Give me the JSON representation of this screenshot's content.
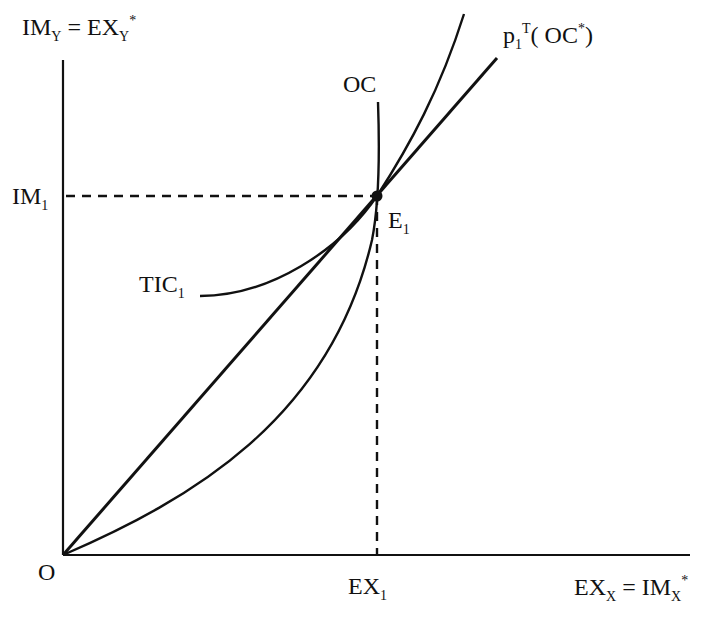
{
  "diagram": {
    "colors": {
      "ink": "#111111",
      "background": "#ffffff"
    },
    "y_axis": {
      "label_main": "IM",
      "label_sub": "Y",
      "label_eq": " = EX",
      "label_eq_sub": "Y",
      "label_sup": "*"
    },
    "x_axis": {
      "label_main": "EX",
      "label_sub": "X",
      "label_eq": " = IM",
      "label_eq_sub": "X",
      "label_sup": "*"
    },
    "origin": {
      "label": "O"
    },
    "ticks": {
      "y_tick": {
        "main": "IM",
        "sub": "1"
      },
      "x_tick": {
        "main": "EX",
        "sub": "1"
      }
    },
    "curves": {
      "oc": {
        "label": "OC"
      },
      "tic": {
        "main": "TIC",
        "sub": "1"
      },
      "tot_line": {
        "main": "p",
        "sub": "1",
        "sup": "T",
        "paren": "( OC",
        "paren_sup": "*",
        "close": ")"
      }
    },
    "equilibrium": {
      "main": "E",
      "sub": "1"
    }
  }
}
